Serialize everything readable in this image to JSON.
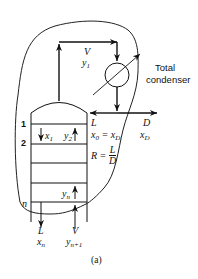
{
  "figure": {
    "caption": "(a)",
    "condenser_label_line1": "Total",
    "condenser_label_line2": "condenser",
    "top_vapor": {
      "flow": "V",
      "comp": "y",
      "comp_sub": "1"
    },
    "reflux": {
      "flow": "L",
      "eq_left": "x",
      "eq_left_sub": "0",
      "eq_mid": " = x",
      "eq_right_sub": "D",
      "ratio_left": "R =",
      "ratio_num": "L",
      "ratio_den": "D"
    },
    "distillate": {
      "flow": "D",
      "comp": "x",
      "comp_sub": "D"
    },
    "stage_labels": {
      "stage1": "1",
      "stage2": "2",
      "stage_n": "n"
    },
    "internal": {
      "x1": "x",
      "x1_sub": "1",
      "y2": "y",
      "y2_sub": "2",
      "yn": "y",
      "yn_sub": "n"
    },
    "bottom_liquid": {
      "flow": "L",
      "comp": "x",
      "comp_sub": "n"
    },
    "bottom_vapor": {
      "flow": "V",
      "comp": "y",
      "comp_sub": "n+1"
    },
    "colors": {
      "line": "#111111",
      "background": "#ffffff"
    }
  }
}
